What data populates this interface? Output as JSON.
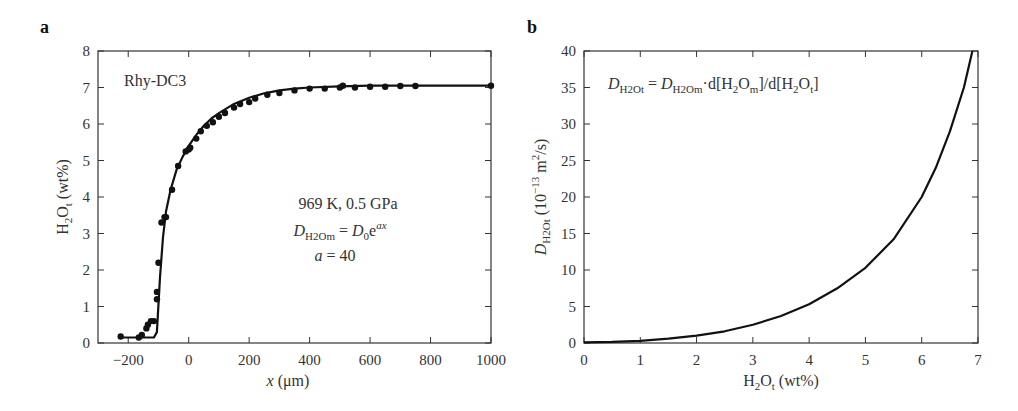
{
  "panels": {
    "a": {
      "label": "a",
      "sample": "Rhy-DC3",
      "condition": "969 K, 0.5 GPa",
      "eq_lhs": "D",
      "eq_lhs_sub": "H2Om",
      "eq_eq": " = ",
      "eq_rhs": "D",
      "eq_rhs_sub": "0",
      "eq_rhs_e": "e",
      "eq_rhs_sup": "ax",
      "param": "a = 40",
      "param_var": "a",
      "param_val": " = 40",
      "xlabel_var": "x",
      "xlabel_unit": " (μm)",
      "ylabel_main": "H",
      "ylabel_sub2": "2",
      "ylabel_o": "O",
      "ylabel_subt": "t",
      "ylabel_unit": " (wt%)"
    },
    "b": {
      "label": "b",
      "eq": "D_H2Ot = D_H2Om·d[H2Om]/d[H2Ot]",
      "xlabel": "H2Ot (wt%)",
      "ylabel": "D_H2Ot (10^-13 m^2/s)"
    }
  },
  "chart_data": [
    {
      "type": "scatter",
      "title": "Rhy-DC3",
      "xlabel": "x (μm)",
      "ylabel": "H2Ot (wt%)",
      "xlim": [
        -300,
        1000
      ],
      "ylim": [
        0,
        8
      ],
      "xticks": [
        -200,
        0,
        200,
        400,
        600,
        800,
        1000
      ],
      "yticks": [
        0,
        1,
        2,
        3,
        4,
        5,
        6,
        7,
        8
      ],
      "annotations": [
        "Rhy-DC3",
        "969 K, 0.5 GPa",
        "D_H2Om = D0·e^(ax)",
        "a = 40"
      ],
      "series": [
        {
          "name": "measured",
          "kind": "points",
          "x": [
            -225,
            -165,
            -155,
            -140,
            -135,
            -125,
            -115,
            -105,
            -105,
            -100,
            -90,
            -80,
            -75,
            -55,
            -35,
            -10,
            0,
            5,
            25,
            40,
            60,
            80,
            100,
            120,
            150,
            170,
            200,
            220,
            260,
            300,
            350,
            400,
            450,
            500,
            510,
            550,
            600,
            650,
            700,
            750,
            1000
          ],
          "y": [
            0.18,
            0.15,
            0.22,
            0.4,
            0.5,
            0.6,
            0.6,
            1.2,
            1.4,
            2.2,
            3.3,
            3.45,
            3.45,
            4.2,
            4.85,
            5.25,
            5.3,
            5.35,
            5.6,
            5.8,
            5.95,
            6.05,
            6.2,
            6.3,
            6.45,
            6.55,
            6.6,
            6.7,
            6.8,
            6.85,
            6.92,
            6.97,
            6.97,
            7.0,
            7.05,
            7.0,
            7.02,
            7.02,
            7.04,
            7.04,
            7.05
          ]
        },
        {
          "name": "model fit",
          "kind": "line",
          "x": [
            -225,
            -115,
            -105,
            -95,
            -85,
            -75,
            -60,
            -40,
            -20,
            0,
            25,
            50,
            75,
            100,
            150,
            200,
            250,
            300,
            350,
            400,
            500,
            600,
            800,
            1000
          ],
          "y": [
            0.15,
            0.15,
            0.3,
            1.8,
            2.9,
            3.6,
            4.2,
            4.75,
            5.1,
            5.4,
            5.7,
            5.95,
            6.15,
            6.3,
            6.55,
            6.72,
            6.84,
            6.92,
            6.97,
            7.0,
            7.03,
            7.05,
            7.05,
            7.05
          ]
        }
      ]
    },
    {
      "type": "line",
      "title": "",
      "xlabel": "H2Ot (wt%)",
      "ylabel": "D_H2Ot (10^-13 m^2/s)",
      "xlim": [
        0,
        7
      ],
      "ylim": [
        0,
        40
      ],
      "xticks": [
        0,
        1,
        2,
        3,
        4,
        5,
        6,
        7
      ],
      "yticks": [
        0,
        5,
        10,
        15,
        20,
        25,
        30,
        35,
        40
      ],
      "annotations": [
        "D_H2Ot = D_H2Om·d[H2Om]/d[H2Ot]"
      ],
      "series": [
        {
          "name": "D_H2Ot",
          "x": [
            0,
            0.5,
            1,
            1.5,
            2,
            2.5,
            3,
            3.5,
            4,
            4.5,
            5,
            5.5,
            6,
            6.25,
            6.5,
            6.75,
            6.9
          ],
          "y": [
            0.1,
            0.15,
            0.3,
            0.6,
            1.0,
            1.6,
            2.5,
            3.7,
            5.3,
            7.5,
            10.3,
            14.2,
            20.0,
            24.0,
            29.0,
            35.0,
            40.0
          ]
        }
      ]
    }
  ]
}
